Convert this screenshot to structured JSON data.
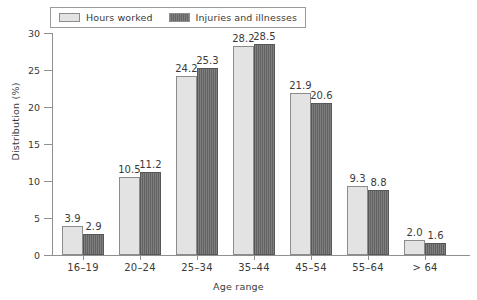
{
  "chart_data": {
    "type": "bar",
    "title": "",
    "xlabel": "Age range",
    "ylabel": "Distribution (%)",
    "ylim": [
      0,
      30
    ],
    "ytick_values": [
      0,
      5,
      10,
      15,
      20,
      25,
      30
    ],
    "ytick_labels": [
      "0",
      "5",
      "10",
      "15",
      "20",
      "25",
      "30"
    ],
    "grid": false,
    "legend_position": "top-left",
    "categories": [
      "16–19",
      "20–24",
      "25–34",
      "35–44",
      "45–54",
      "55–64",
      "> 64"
    ],
    "series": [
      {
        "name": "Hours worked",
        "color": "#e3e3e3",
        "values": [
          3.9,
          10.5,
          24.2,
          28.2,
          21.9,
          9.3,
          2.0
        ],
        "labels": [
          "3.9",
          "10.5",
          "24.2",
          "28.2",
          "21.9",
          "9.3",
          "2.0"
        ]
      },
      {
        "name": "Injuries and illnesses",
        "color": "#6d6d6d",
        "values": [
          2.9,
          11.2,
          25.3,
          28.5,
          20.6,
          8.8,
          1.6
        ],
        "labels": [
          "2.9",
          "11.2",
          "25.3",
          "28.5",
          "20.6",
          "8.8",
          "1.6"
        ]
      }
    ]
  },
  "legend": {
    "entries": [
      {
        "label": "Hours worked",
        "swatch": "light"
      },
      {
        "label": "Injuries and illnesses",
        "swatch": "dark"
      }
    ]
  },
  "colors": {
    "series_light": "#e3e3e3",
    "series_dark": "#6d6d6d",
    "axis": "#8f8f8f",
    "text": "#3a3a3a",
    "background": "#ffffff"
  }
}
